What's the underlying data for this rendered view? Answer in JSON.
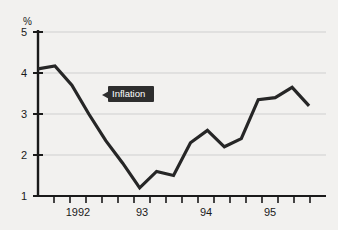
{
  "chart_data": {
    "type": "line",
    "title": "",
    "subtitle": "",
    "xlabel": "",
    "ylabel": "%",
    "ylim": [
      1,
      5
    ],
    "yticks": [
      1,
      2,
      3,
      4,
      5
    ],
    "ytick_labels": [
      "1",
      "2",
      "3",
      "4",
      "5"
    ],
    "xtick_labels": [
      "1992",
      "93",
      "94",
      "95"
    ],
    "xtick_positions": [
      1992,
      1993,
      1994,
      1995
    ],
    "xlim": [
      1991.5,
      1995.75
    ],
    "grid": true,
    "grid_axis": "y",
    "legend": "none",
    "annotations": [
      {
        "text": "Inflation",
        "x": 1992.25,
        "y": 3.45,
        "style": "dark-callout-with-left-arrow"
      }
    ],
    "series": [
      {
        "name": "Inflation",
        "color": "#262626",
        "x": [
          1991.5,
          1991.75,
          1992.0,
          1992.25,
          1992.5,
          1992.75,
          1993.0,
          1993.25,
          1993.5,
          1993.75,
          1994.0,
          1994.25,
          1994.5,
          1994.75,
          1995.0,
          1995.25,
          1995.5
        ],
        "values": [
          4.1,
          4.17,
          3.7,
          3.0,
          2.35,
          1.8,
          1.2,
          1.6,
          1.5,
          2.3,
          2.6,
          2.2,
          2.4,
          3.35,
          3.4,
          3.65,
          3.2
        ]
      }
    ]
  },
  "axis": {
    "unit_label": "%"
  },
  "colors": {
    "background": "#f2f1ef",
    "line": "#262626",
    "grid": "#cfcfcf",
    "axis": "#1a1a1a",
    "annotation_bg": "#2e2e2e",
    "annotation_text": "#ffffff"
  }
}
